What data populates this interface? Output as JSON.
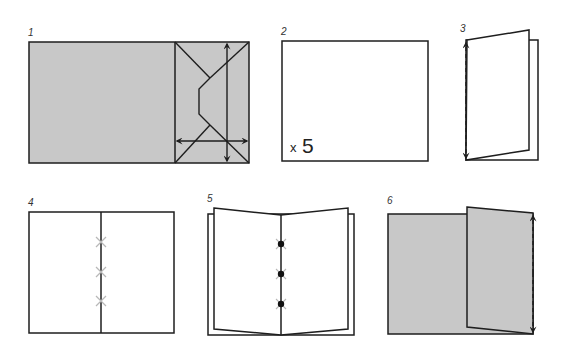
{
  "colors": {
    "stroke": "#1e1e1e",
    "fill_gray": "#c8c8c8",
    "paper": "#ffffff",
    "stitch": "#b8b8b8"
  },
  "steps": [
    {
      "label": "1",
      "description": "envelope-folded cover with arrows"
    },
    {
      "label": "2",
      "description": "sheet of paper",
      "count_prefix": "x",
      "count_value": "5"
    },
    {
      "label": "3",
      "description": "fold sheet in half"
    },
    {
      "label": "4",
      "description": "open sheets with stitch marks"
    },
    {
      "label": "5",
      "description": "stitched booklet"
    },
    {
      "label": "6",
      "description": "fold cover flap"
    }
  ]
}
